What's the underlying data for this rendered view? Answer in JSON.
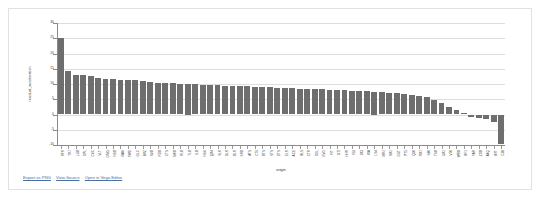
{
  "frame": {
    "name": "chart-card"
  },
  "chart_data": {
    "type": "bar",
    "title": "",
    "subtitle": "",
    "xlabel": "origin",
    "ylabel": "residual_acceleration",
    "grid": true,
    "legend": null,
    "bar_color": "#6e6e6e",
    "ylim": [
      -10,
      30
    ],
    "y_ticks": [
      -10,
      -5,
      0,
      5,
      10,
      15,
      20,
      25,
      30
    ],
    "y_tick_labels": [
      "-10",
      "-5",
      "0",
      "5",
      "10",
      "15",
      "20",
      "25",
      "30"
    ],
    "categories": [
      "RFR",
      "TR7",
      "LUX",
      "DPL",
      "CVC",
      "VLT",
      "OMG",
      "NSX",
      "MAV",
      "FWD",
      "GLC",
      "BRZ",
      "SVX",
      "RDX",
      "CTS",
      "MKX",
      "RLX",
      "TLX",
      "ILX",
      "NSV",
      "QX4",
      "SLK",
      "GLK",
      "XLR",
      "SRX",
      "ATS",
      "CT6",
      "XTS",
      "STS",
      "DTS",
      "ELR",
      "ACE",
      "BLS",
      "CTR",
      "DEL",
      "EVO",
      "FIT",
      "GTI",
      "HHR",
      "IS3",
      "JX3",
      "KIA",
      "LS4",
      "MR2",
      "NX2",
      "OUT",
      "PT5",
      "Q50",
      "RX7",
      "S40",
      "TSX",
      "UX2",
      "V70",
      "WRX",
      "XF1",
      "YAR",
      "ZDX",
      "A4Q",
      "B9T",
      "C30"
    ],
    "values": [
      25.2,
      14.3,
      13.1,
      13.0,
      12.7,
      11.9,
      11.6,
      11.5,
      11.4,
      11.3,
      11.2,
      10.9,
      10.6,
      10.4,
      10.3,
      10.2,
      10.1,
      10.0,
      9.9,
      9.8,
      9.7,
      9.6,
      9.5,
      9.4,
      9.3,
      9.2,
      9.1,
      9.0,
      8.9,
      8.8,
      8.7,
      8.6,
      8.5,
      8.4,
      8.3,
      8.2,
      8.1,
      8.0,
      7.9,
      7.8,
      7.7,
      7.6,
      7.5,
      7.4,
      7.2,
      7.0,
      6.8,
      6.5,
      6.1,
      5.6,
      4.9,
      3.9,
      2.6,
      1.5,
      0.6,
      -0.9,
      -1.3,
      -1.5,
      -2.4,
      -9.7
    ]
  },
  "embed_actions": {
    "export_png": "Export as PNG",
    "view_source": "View Source",
    "open_in_vega_editor": "Open in Vega Editor"
  }
}
